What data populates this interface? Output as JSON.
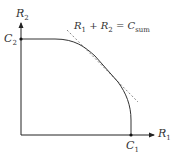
{
  "diagram": {
    "type": "capacity region",
    "axes": {
      "x_label": "R",
      "x_label_sub": "1",
      "y_label": "R",
      "y_label_sub": "2"
    },
    "points": {
      "c1_label": "C",
      "c1_sub": "1",
      "c2_label": "C",
      "c2_sub": "2"
    },
    "tangent_line": {
      "label_lhs1": "R",
      "label_lhs1_sub": "1",
      "label_plus": " + ",
      "label_lhs2": "R",
      "label_lhs2_sub": "2",
      "label_eq": " = ",
      "label_rhs": "C",
      "label_rhs_sub": "sum"
    },
    "colors": {
      "axis": "#222222",
      "curve": "#333333",
      "tangent": "#888888"
    }
  }
}
